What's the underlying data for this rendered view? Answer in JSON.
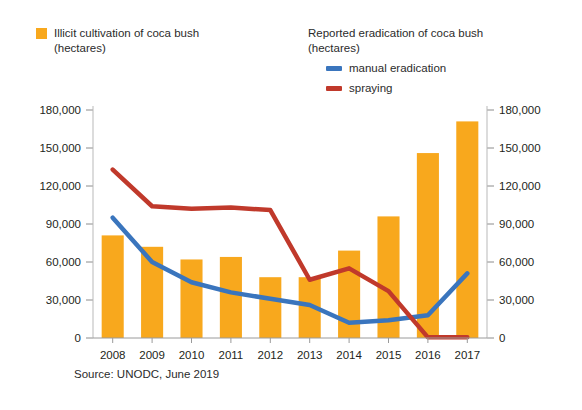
{
  "legend": {
    "left": {
      "title": "Illicit cultivation of coca bush\n(hectares)",
      "swatch_color": "#F8A81D",
      "swatch_name": "orange-square"
    },
    "right": {
      "title": "Reported eradication of coca bush\n(hectares)",
      "items": [
        {
          "label": "manual eradication",
          "color": "#3A75BD"
        },
        {
          "label": "spraying",
          "color": "#C0392B"
        }
      ]
    }
  },
  "source": "Source: UNODC, June 2019",
  "chart_data": {
    "type": "bar",
    "title": "",
    "subtitle": "",
    "xlabel": "",
    "ylabel": "",
    "ylim": [
      0,
      180000
    ],
    "yticks": [
      0,
      30000,
      60000,
      90000,
      120000,
      150000,
      180000
    ],
    "ytick_labels": [
      "0",
      "30,000",
      "60,000",
      "90,000",
      "120,000",
      "150,000",
      "180,000"
    ],
    "right_axis": {
      "ylim": [
        0,
        180000
      ],
      "yticks": [
        0,
        30000,
        60000,
        90000,
        120000,
        150000,
        180000
      ],
      "ytick_labels": [
        "0",
        "30,000",
        "60,000",
        "90,000",
        "120,000",
        "150,000",
        "180,000"
      ]
    },
    "grid": false,
    "legend_position": "top",
    "categories": [
      "2008",
      "2009",
      "2010",
      "2011",
      "2012",
      "2013",
      "2014",
      "2015",
      "2016",
      "2017"
    ],
    "series": [
      {
        "name": "Illicit cultivation of coca bush (hectares)",
        "type": "bar",
        "color": "#F8A81D",
        "values": [
          81000,
          72000,
          62000,
          64000,
          48000,
          48000,
          69000,
          96000,
          146000,
          171000
        ]
      },
      {
        "name": "manual eradication",
        "type": "line",
        "color": "#3A75BD",
        "values": [
          95000,
          60000,
          44000,
          36000,
          31000,
          26000,
          12000,
          14000,
          18000,
          51000
        ]
      },
      {
        "name": "spraying",
        "type": "line",
        "color": "#C0392B",
        "values": [
          133000,
          104000,
          102000,
          103000,
          101000,
          46000,
          55000,
          37000,
          500,
          500
        ]
      }
    ]
  }
}
